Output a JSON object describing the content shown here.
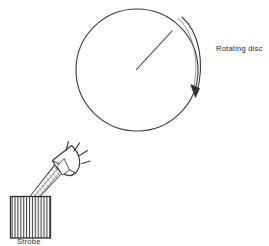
{
  "figure": {
    "background_color": "#ffffff",
    "ink_color": "#3a3a3a",
    "text_color": "#2b2b2b",
    "width": 269,
    "height": 246
  },
  "labels": {
    "rotating_disc": "Rotating disc",
    "strobe": "Strobe"
  },
  "disc": {
    "name": "rotating-disc",
    "center_x": 137,
    "center_y": 70,
    "radius": 61,
    "radius_mark": {
      "from_x": 136,
      "from_y": 69,
      "to_x": 172,
      "to_y": 31
    }
  },
  "rotation_arrow": {
    "name": "rotation-direction-arrow",
    "direction": "clockwise",
    "arrowhead_x": 196,
    "arrowhead_y": 95
  },
  "strobe": {
    "name": "strobe-unit",
    "body": {
      "x": 10,
      "y": 196,
      "width": 40,
      "height": 42,
      "hatch": "vertical-lines"
    },
    "gooseneck": {
      "hatch": "coil",
      "from_x": 32,
      "from_y": 196,
      "to_x": 60,
      "to_y": 166
    },
    "reflector": {
      "center_x": 66,
      "center_y": 158,
      "shape": "cone-bell"
    },
    "light_rays": {
      "count": 4,
      "direction": "up-right"
    }
  }
}
